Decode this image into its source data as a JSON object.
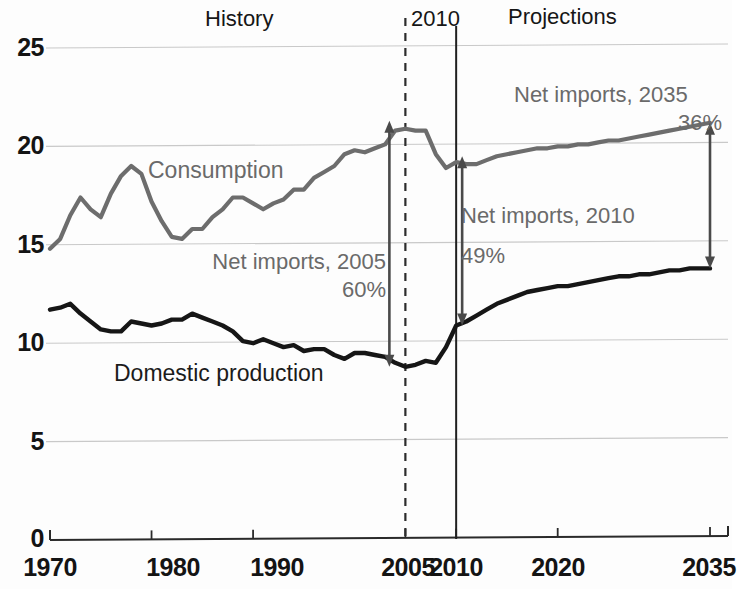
{
  "headers": {
    "history": "History",
    "divider_year": "2010",
    "projections": "Projections"
  },
  "series_labels": {
    "consumption": "Consumption",
    "domestic_production": "Domestic production"
  },
  "annotations": [
    {
      "name": "net-imports-2005",
      "title": "Net imports, 2005",
      "value": "60%"
    },
    {
      "name": "net-imports-2010",
      "title": "Net imports, 2010",
      "value": "49%"
    },
    {
      "name": "net-imports-2035",
      "title": "Net imports, 2035",
      "value": "36%"
    }
  ],
  "axes": {
    "y_ticks": [
      "25",
      "20",
      "15",
      "10",
      "5",
      "0"
    ],
    "x_ticks": [
      "1970",
      "1980",
      "1990",
      "2005",
      "2010",
      "2020",
      "2035"
    ]
  },
  "colors": {
    "consumption_line": "#6d6d6d",
    "production_line": "#161616",
    "gridline": "#c9c9c9",
    "axis": "#2a2a2a",
    "annotation_text": "#6a6a6a",
    "arrow": "#4a4a4a"
  },
  "chart_data": {
    "type": "line",
    "title": "",
    "subtitle": "",
    "xlabel": "",
    "ylabel": "",
    "xlim": [
      1970,
      2035
    ],
    "ylim": [
      0,
      25
    ],
    "grid": true,
    "legend": "inline-labels",
    "y_tick_values": [
      0,
      5,
      10,
      15,
      20,
      25
    ],
    "x_tick_values": [
      1970,
      1980,
      1990,
      2005,
      2010,
      2020,
      2035
    ],
    "history_range": [
      1970,
      2010
    ],
    "projection_range": [
      2010,
      2035
    ],
    "divider_year": 2010,
    "marker_year_dashed": 2005,
    "annotations_data": [
      {
        "label": "Net imports, 2005",
        "value_pct": 60,
        "year": 2005,
        "from": 8.7,
        "to": 21.2
      },
      {
        "label": "Net imports, 2010",
        "value_pct": 49,
        "year": 2010,
        "from": 10.8,
        "to": 19.4
      },
      {
        "label": "Net imports, 2035",
        "value_pct": 36,
        "year": 2035,
        "from": 13.7,
        "to": 21.1
      }
    ],
    "x": [
      1970,
      1971,
      1972,
      1973,
      1974,
      1975,
      1976,
      1977,
      1978,
      1979,
      1980,
      1981,
      1982,
      1983,
      1984,
      1985,
      1986,
      1987,
      1988,
      1989,
      1990,
      1991,
      1992,
      1993,
      1994,
      1995,
      1996,
      1997,
      1998,
      1999,
      2000,
      2001,
      2002,
      2003,
      2004,
      2005,
      2006,
      2007,
      2008,
      2009,
      2010,
      2011,
      2012,
      2013,
      2014,
      2015,
      2016,
      2017,
      2018,
      2019,
      2020,
      2021,
      2022,
      2023,
      2024,
      2025,
      2026,
      2027,
      2028,
      2029,
      2030,
      2031,
      2032,
      2033,
      2034,
      2035
    ],
    "series": [
      {
        "name": "Consumption",
        "color": "#6d6d6d",
        "values": [
          14.7,
          15.2,
          16.4,
          17.3,
          16.7,
          16.3,
          17.5,
          18.4,
          18.9,
          18.5,
          17.1,
          16.1,
          15.3,
          15.2,
          15.7,
          15.7,
          16.3,
          16.7,
          17.3,
          17.3,
          17.0,
          16.7,
          17.0,
          17.2,
          17.7,
          17.7,
          18.3,
          18.6,
          18.9,
          19.5,
          19.7,
          19.6,
          19.8,
          20.0,
          20.7,
          20.8,
          20.7,
          20.7,
          19.5,
          18.8,
          19.1,
          19.0,
          19.0,
          19.2,
          19.4,
          19.5,
          19.6,
          19.7,
          19.8,
          19.8,
          19.9,
          19.9,
          20.0,
          20.0,
          20.1,
          20.2,
          20.2,
          20.3,
          20.4,
          20.5,
          20.6,
          20.7,
          20.8,
          20.9,
          21.0,
          21.1
        ]
      },
      {
        "name": "Domestic production",
        "color": "#161616",
        "values": [
          11.6,
          11.7,
          11.9,
          11.4,
          11.0,
          10.6,
          10.5,
          10.5,
          11.0,
          10.9,
          10.8,
          10.9,
          11.1,
          11.1,
          11.4,
          11.2,
          11.0,
          10.8,
          10.5,
          10.0,
          9.9,
          10.1,
          9.9,
          9.7,
          9.8,
          9.5,
          9.6,
          9.6,
          9.3,
          9.1,
          9.4,
          9.4,
          9.3,
          9.2,
          8.9,
          8.7,
          8.8,
          9.0,
          8.9,
          9.7,
          10.8,
          11.0,
          11.3,
          11.6,
          11.9,
          12.1,
          12.3,
          12.5,
          12.6,
          12.7,
          12.8,
          12.8,
          12.9,
          13.0,
          13.1,
          13.2,
          13.3,
          13.3,
          13.4,
          13.4,
          13.5,
          13.6,
          13.6,
          13.7,
          13.7,
          13.7
        ]
      }
    ]
  }
}
